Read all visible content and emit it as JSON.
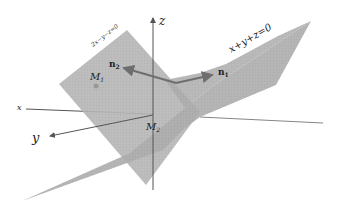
{
  "labels": {
    "z_axis": "z",
    "x_axis": "x",
    "y_axis": "y",
    "plane1_eq": "2x−y−z=0",
    "plane2_eq": "x+y+z=0",
    "n1": "n",
    "n1_sub": "1",
    "n2": "n",
    "n2_sub": "2",
    "M1": "M",
    "M1_sub": "1",
    "M2": "M",
    "M2_sub": "2"
  },
  "colors": {
    "plane": "#b3b3b3",
    "plane_dark": "#9a9a9a",
    "axis": "#555555",
    "vector": "#707070"
  }
}
